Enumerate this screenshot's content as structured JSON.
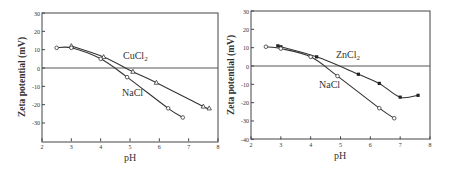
{
  "chart_data": [
    {
      "type": "line",
      "panel": "left",
      "title": "",
      "xlabel": "pH",
      "ylabel": "Zeta potential (mV)",
      "xlim": [
        2,
        8
      ],
      "ylim": [
        -40,
        30
      ],
      "xticks": [
        2,
        3,
        4,
        5,
        6,
        7,
        8
      ],
      "yticks": [
        30,
        20,
        10,
        0,
        -10,
        -20,
        -30
      ],
      "grid": false,
      "zero_line": true,
      "series": [
        {
          "name": "CuCl2",
          "label_main": "CuCl",
          "label_sub": "2",
          "marker": "triangle-open",
          "x": [
            3.0,
            4.1,
            5.1,
            5.9,
            7.5,
            7.7
          ],
          "y": [
            12,
            6,
            -2,
            -8,
            -21,
            -22
          ]
        },
        {
          "name": "NaCl",
          "label_main": "NaCl",
          "label_sub": "",
          "marker": "circle-open",
          "x": [
            2.5,
            3.0,
            4.0,
            4.9,
            6.3,
            6.8
          ],
          "y": [
            11,
            11,
            5,
            -5,
            -22,
            -27
          ]
        }
      ]
    },
    {
      "type": "line",
      "panel": "right",
      "title": "",
      "xlabel": "pH",
      "ylabel": "Zeta potential (mV)",
      "xlim": [
        2,
        8
      ],
      "ylim": [
        -40,
        30
      ],
      "xticks": [
        2,
        3,
        4,
        5,
        6,
        7,
        8
      ],
      "yticks": [
        30,
        20,
        10,
        0,
        -10,
        -20,
        -30,
        -40
      ],
      "grid": false,
      "zero_line": true,
      "series": [
        {
          "name": "ZnCl2",
          "label_main": "ZnCl",
          "label_sub": "2",
          "marker": "square-filled",
          "x": [
            2.9,
            3.0,
            4.2,
            5.6,
            6.3,
            7.0,
            7.6
          ],
          "y": [
            11,
            10.5,
            5,
            -4.5,
            -9.5,
            -17,
            -16
          ]
        },
        {
          "name": "NaCl",
          "label_main": "NaCl",
          "label_sub": "",
          "marker": "circle-open",
          "x": [
            2.5,
            3.0,
            4.0,
            4.9,
            6.3,
            6.8
          ],
          "y": [
            10.5,
            9.5,
            5,
            -5.5,
            -23,
            -28.5
          ]
        }
      ]
    }
  ],
  "left": {
    "xlabel": "pH",
    "ylabel": "Zeta potential (mV)",
    "series_label_1": "CuCl",
    "series_label_1_sub": "2",
    "series_label_2": "NaCl"
  },
  "right": {
    "xlabel": "pH",
    "ylabel": "Zeta potential (mV)",
    "series_label_1": "ZnCl",
    "series_label_1_sub": "2",
    "series_label_2": "NaCl"
  }
}
